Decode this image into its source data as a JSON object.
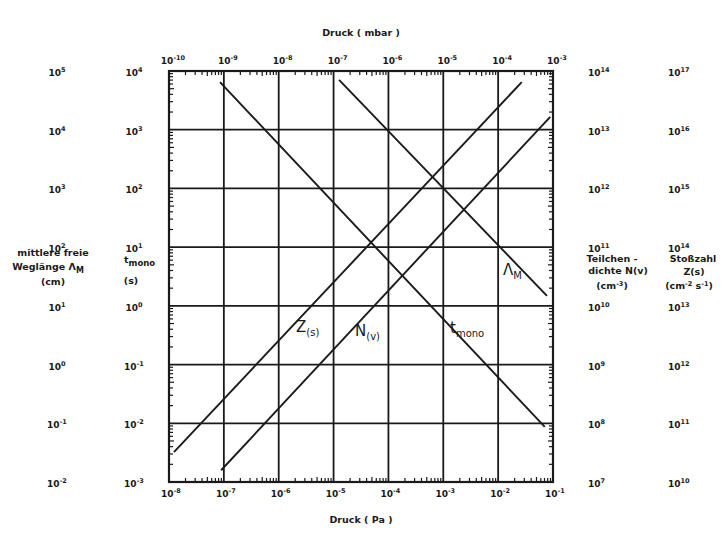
{
  "chart_data": {
    "type": "line",
    "title": "",
    "x_axis_bottom": {
      "label": "Druck (Pa)",
      "scale": "log",
      "range_exp": [
        -8,
        -1
      ],
      "ticks": [
        "10^-8",
        "10^-7",
        "10^-6",
        "10^-5",
        "10^-4",
        "10^-3",
        "10^-2",
        "10^-1"
      ]
    },
    "x_axis_top": {
      "label": "Druck (mbar)",
      "scale": "log",
      "range_exp": [
        -10,
        -3
      ],
      "ticks": [
        "10^-10",
        "10^-9",
        "10^-8",
        "10^-7",
        "10^-6",
        "10^-5",
        "10^-4",
        "10^-3"
      ]
    },
    "y_axes": [
      {
        "id": "lambda",
        "side": "left-outer",
        "label_lines": [
          "mittlere freie",
          "Weglänge Λ_M",
          "(cm)"
        ],
        "scale": "log",
        "range_exp": [
          -2,
          5
        ],
        "ticks": [
          "10^5",
          "10^4",
          "10^3",
          "10^2",
          "10^1",
          "10^0",
          "10^-1",
          "10^-2"
        ]
      },
      {
        "id": "tmono",
        "side": "left-inner",
        "label_lines": [
          "t_mono",
          "(s)"
        ],
        "scale": "log",
        "range_exp": [
          -3,
          4
        ],
        "ticks": [
          "10^4",
          "10^3",
          "10^2",
          "10^1",
          "10^0",
          "10^-1",
          "10^-2",
          "10^-3"
        ]
      },
      {
        "id": "N",
        "side": "right-inner",
        "label_lines": [
          "Teilchen -",
          "dichte N(v)",
          "(cm^-3)"
        ],
        "scale": "log",
        "range_exp": [
          7,
          14
        ],
        "ticks": [
          "10^14",
          "10^13",
          "10^12",
          "10^11",
          "10^10",
          "10^9",
          "10^8",
          "10^7"
        ]
      },
      {
        "id": "Z",
        "side": "right-outer",
        "label_lines": [
          "Stoßzahl",
          "Z(s)",
          "(cm^-2 s^-1)"
        ],
        "scale": "log",
        "range_exp": [
          10,
          17
        ],
        "ticks": [
          "10^17",
          "10^16",
          "10^15",
          "10^14",
          "10^13",
          "10^12",
          "10^11",
          "10^10"
        ]
      }
    ],
    "grid": true,
    "series": [
      {
        "name": "t_mono",
        "axis": "tmono",
        "label_main": "t",
        "label_sub": "mono",
        "points_log_pa": [
          [
            -7.07,
            3.81
          ],
          [
            -1.15,
            -2.06
          ]
        ]
      },
      {
        "name": "Λ_M",
        "axis": "lambda",
        "label_main": "Λ",
        "label_sub": "M",
        "points_log_pa": [
          [
            -4.9,
            4.85
          ],
          [
            -1.11,
            1.17
          ]
        ]
      },
      {
        "name": "Z(s)",
        "axis": "Z",
        "label_main": "Z",
        "label_sub": "(s)",
        "points_log_pa": [
          [
            -7.91,
            10.51
          ],
          [
            -1.57,
            16.81
          ]
        ]
      },
      {
        "name": "N(v)",
        "axis": "N",
        "label_main": "N",
        "label_sub": "(v)",
        "points_log_pa": [
          [
            -7.05,
            7.2
          ],
          [
            -1.05,
            13.22
          ]
        ]
      }
    ]
  },
  "labels": {
    "top_axis_title": "Druck ( mbar )",
    "bottom_axis_title": "Druck ( Pa )",
    "left_outer_title": [
      "mittlere freie",
      "Weglänge Λ",
      "(cm)"
    ],
    "left_inner_title": [
      "t",
      "(s)"
    ],
    "right_inner_title": [
      "Teilchen -",
      "dichte N(v)",
      "(cm",
      ")"
    ],
    "right_outer_title": [
      "Stoßzahl",
      "Z(s)",
      "(cm",
      " s",
      ")"
    ]
  }
}
